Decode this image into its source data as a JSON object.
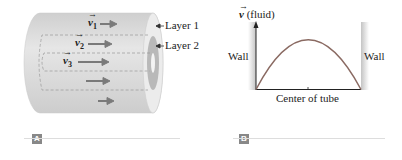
{
  "panel_a": {
    "tag": "A",
    "velocities": [
      {
        "symbol": "v",
        "subscript": "1"
      },
      {
        "symbol": "v",
        "subscript": "2"
      },
      {
        "symbol": "v",
        "subscript": "3"
      }
    ],
    "layer_labels": [
      "Layer 1",
      "Layer 2"
    ]
  },
  "panel_b": {
    "tag": "B",
    "y_label_symbol": "v",
    "y_label_text": "(fluid)",
    "left_wall": "Wall",
    "right_wall": "Wall",
    "x_label": "Center of tube"
  },
  "colors": {
    "tube_body": "#d9d9d9",
    "arrow": "#7a7a7a",
    "curve": "#8a6a62",
    "tag_bg": "#888888"
  }
}
